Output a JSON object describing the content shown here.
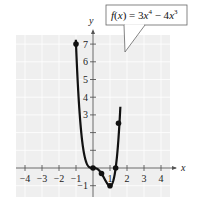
{
  "chart_data": {
    "type": "line",
    "title": "",
    "function_label": "f(x) = 3x⁴ − 4x³",
    "function_label_parts": {
      "prefix": "f",
      "var": "x",
      "eq": " = 3",
      "x1": "x",
      "exp1": "4",
      "minus": " − 4",
      "x2": "x",
      "exp2": "3"
    },
    "xlabel": "x",
    "ylabel": "y",
    "xlim": [
      -4.5,
      4.5
    ],
    "ylim": [
      -1.5,
      7.5
    ],
    "x_ticks": [
      -4,
      -3,
      -2,
      -1,
      1,
      2,
      3,
      4
    ],
    "x_tick_labels": [
      "−4",
      "−3",
      "−2",
      "−1",
      "1",
      "2",
      "3",
      "4"
    ],
    "y_ticks": [
      -1,
      1,
      2,
      3,
      4,
      5,
      6,
      7
    ],
    "y_tick_labels": [
      "−1",
      "",
      "",
      "3",
      "4",
      "5",
      "6",
      "7"
    ],
    "grid": true,
    "series": [
      {
        "name": "f(x) = 3x^4 - 4x^3",
        "points": [
          [
            -1,
            7
          ],
          [
            0,
            0
          ],
          [
            0.5,
            -0.3125
          ],
          [
            1,
            -1
          ],
          [
            1.3333,
            0
          ],
          [
            1.5,
            2.5313
          ]
        ]
      }
    ],
    "colors": {
      "plot_bg": "#efefef",
      "grid": "#ffffff",
      "curve": "#111111",
      "axis": "#555555"
    }
  }
}
